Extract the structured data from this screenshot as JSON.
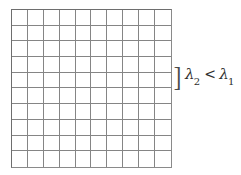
{
  "figure": {
    "type": "lattice-grid-diagram",
    "background_color": "#ffffff",
    "grid": {
      "rows": 10,
      "columns": 10,
      "cell_count": 100,
      "line_color": "#858585",
      "border_color": "#6e6e6e",
      "fill_color": "#ffffff"
    },
    "annotation": {
      "bracket": "]",
      "bracket_name": "right-square-bracket",
      "formula_plain": "λ2 < λ1",
      "lambda_symbol": "λ",
      "first_subscript": "2",
      "relation": "<",
      "second_subscript": "1",
      "text_color": "#2e2e2e",
      "spans_rows": 1
    }
  }
}
